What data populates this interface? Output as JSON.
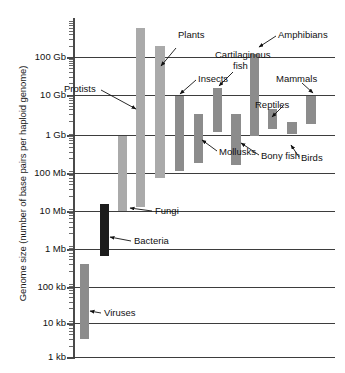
{
  "chart_data": {
    "type": "bar",
    "title": "",
    "xlabel": "",
    "ylabel": "Genome size (number of base pairs per haploid genome)",
    "scale": "log10",
    "grid": true,
    "legend": "none",
    "ylim_labels": [
      "1 kb",
      "10 kb",
      "100 kb",
      "1 Mb",
      "10 Mb",
      "100 Mb",
      "1 Gb",
      "10 Gb",
      "100 Gb"
    ],
    "ytick_values_bp": [
      1000,
      10000,
      100000,
      1000000,
      10000000,
      100000000,
      1000000000,
      10000000000,
      100000000000
    ],
    "note": "Floating range bars: each bar spans the minimum to maximum genome size of the group",
    "categories": [
      "Viruses",
      "Bacteria",
      "Fungi",
      "Protists",
      "Plants",
      "Insects",
      "Mollusks",
      "Cartilaginous fish",
      "Bony fish",
      "Amphibians",
      "Reptiles",
      "Birds",
      "Mammals"
    ],
    "ranges_bp": [
      {
        "name": "Viruses",
        "min": 3000,
        "max": 300000
      },
      {
        "name": "Bacteria",
        "min": 500000,
        "max": 12000000
      },
      {
        "name": "Fungi",
        "min": 8000000,
        "max": 800000000
      },
      {
        "name": "Protists",
        "min": 10000000,
        "max": 600000000000
      },
      {
        "name": "Plants",
        "min": 60000000,
        "max": 200000000000
      },
      {
        "name": "Insects",
        "min": 90000000,
        "max": 9000000000
      },
      {
        "name": "Mollusks",
        "min": 150000000,
        "max": 3000000000
      },
      {
        "name": "Cartilaginous fish",
        "min": 1000000000,
        "max": 15000000000
      },
      {
        "name": "Bony fish",
        "min": 130000000,
        "max": 3000000000
      },
      {
        "name": "Amphibians",
        "min": 800000000,
        "max": 120000000000
      },
      {
        "name": "Reptiles",
        "min": 1200000000,
        "max": 4000000000
      },
      {
        "name": "Birds",
        "min": 900000000,
        "max": 1800000000
      },
      {
        "name": "Mammals",
        "min": 1600000000,
        "max": 9000000000
      }
    ],
    "annotations": [
      {
        "label": "Protists"
      },
      {
        "label": "Plants"
      },
      {
        "label": "Insects"
      },
      {
        "label": "Cartilaginous fish"
      },
      {
        "label": "Amphibians"
      },
      {
        "label": "Mammals"
      },
      {
        "label": "Reptiles"
      },
      {
        "label": "Mollusks"
      },
      {
        "label": "Bony fish"
      },
      {
        "label": "Birds"
      },
      {
        "label": "Fungi"
      },
      {
        "label": "Bacteria"
      },
      {
        "label": "Viruses"
      }
    ]
  },
  "axis": {
    "title": "Genome size (number of base pairs per haploid genome)",
    "ticks": [
      {
        "label": "100 Gb"
      },
      {
        "label": "10 Gb"
      },
      {
        "label": "1 Gb"
      },
      {
        "label": "100 Mb"
      },
      {
        "label": "10 Mb"
      },
      {
        "label": "1 Mb"
      },
      {
        "label": "100 kb"
      },
      {
        "label": "10 kb"
      },
      {
        "label": "1 kb"
      }
    ]
  },
  "labels": {
    "protists": "Protists",
    "plants": "Plants",
    "insects": "Insects",
    "cart_fish_1": "Cartilaginous",
    "cart_fish_2": "fish",
    "amphibians": "Amphibians",
    "mammals": "Mammals",
    "reptiles": "Reptiles",
    "mollusks": "Mollusks",
    "bony_fish": "Bony fish",
    "birds": "Birds",
    "fungi": "Fungi",
    "bacteria": "Bacteria",
    "viruses": "Viruses"
  },
  "colors": {
    "bar_light": "#aaaaaa",
    "bar_medium": "#8c8c8c",
    "bar_dark": "#1c1c1c",
    "gridline": "#3d3d3d",
    "axis": "#4a4a4a",
    "text": "#111111"
  }
}
